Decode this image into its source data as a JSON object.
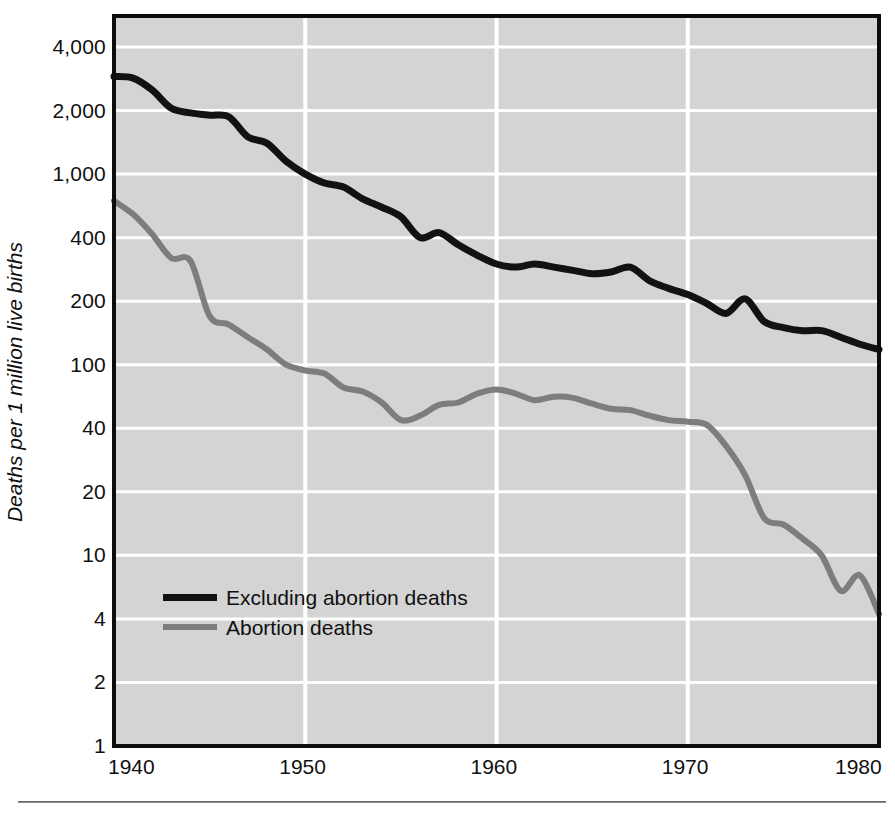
{
  "chart_data": {
    "type": "line",
    "title": "",
    "xlabel": "",
    "ylabel": "Deaths per 1 million live births",
    "xlim": [
      1940,
      1980
    ],
    "ylim": [
      1,
      8000
    ],
    "yscale": "log",
    "grid": true,
    "legend_position": "inside-lower-left",
    "x_ticks": [
      "1940",
      "1950",
      "1960",
      "1970",
      "1980"
    ],
    "x_tick_values": [
      1940,
      1950,
      1960,
      1970,
      1980
    ],
    "y_ticks": [
      "4,000",
      "2,000",
      "1,000",
      "400",
      "200",
      "100",
      "40",
      "20",
      "10",
      "4",
      "2",
      "1"
    ],
    "y_tick_values": [
      4000,
      2000,
      1000,
      400,
      200,
      100,
      40,
      20,
      10,
      4,
      2,
      1
    ],
    "series": [
      {
        "name": "Excluding abortion deaths",
        "color": "#121212",
        "x": [
          1940,
          1941,
          1942,
          1943,
          1944,
          1945,
          1946,
          1947,
          1948,
          1949,
          1950,
          1951,
          1952,
          1953,
          1954,
          1955,
          1956,
          1957,
          1958,
          1959,
          1960,
          1961,
          1962,
          1963,
          1964,
          1965,
          1966,
          1967,
          1968,
          1969,
          1970,
          1971,
          1972,
          1973,
          1974,
          1975,
          1976,
          1977,
          1978,
          1979,
          1980
        ],
        "values": [
          2900,
          2850,
          2500,
          2050,
          1950,
          1900,
          1870,
          1500,
          1400,
          1150,
          1000,
          880,
          830,
          700,
          620,
          540,
          400,
          430,
          370,
          330,
          300,
          290,
          300,
          290,
          280,
          270,
          275,
          290,
          250,
          230,
          215,
          195,
          175,
          205,
          160,
          150,
          145,
          145,
          135,
          125,
          118
        ]
      },
      {
        "name": "Abortion deaths",
        "color": "#7d7d7d",
        "x": [
          1940,
          1941,
          1942,
          1943,
          1944,
          1945,
          1946,
          1947,
          1948,
          1949,
          1950,
          1951,
          1952,
          1953,
          1954,
          1955,
          1956,
          1957,
          1958,
          1959,
          1960,
          1961,
          1962,
          1963,
          1964,
          1965,
          1966,
          1967,
          1968,
          1969,
          1970,
          1971,
          1972,
          1973,
          1974,
          1975,
          1976,
          1977,
          1978,
          1979,
          1980
        ],
        "values": [
          680,
          560,
          420,
          320,
          310,
          170,
          155,
          135,
          118,
          100,
          92,
          88,
          72,
          68,
          58,
          45,
          48,
          56,
          58,
          66,
          70,
          66,
          60,
          63,
          62,
          57,
          53,
          52,
          48,
          45,
          44,
          42,
          33,
          24,
          15,
          14,
          12,
          10,
          6,
          7.5,
          4.3
        ]
      }
    ]
  },
  "axis": {
    "y_title": "Deaths per 1 million live births"
  },
  "legend": {
    "items": [
      {
        "label": "Excluding abortion deaths",
        "color": "#121212"
      },
      {
        "label": "Abortion deaths",
        "color": "#7d7d7d"
      }
    ]
  },
  "style": {
    "plot_background": "#d4d4d4",
    "gridline_color": "#ffffff",
    "border_color": "#0d0d0d",
    "page_background": "#ffffff",
    "footer_rule_color": "#8c8c8c"
  }
}
